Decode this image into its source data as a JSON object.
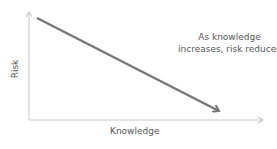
{
  "diagram": {
    "y_axis_label": "Risk",
    "x_axis_label": "Knowledge",
    "annotation_line1": "As knowledge",
    "annotation_line2": "increases, risk reduces",
    "trend_line_color": "#777777",
    "axis_color": "#c8c8c8"
  }
}
